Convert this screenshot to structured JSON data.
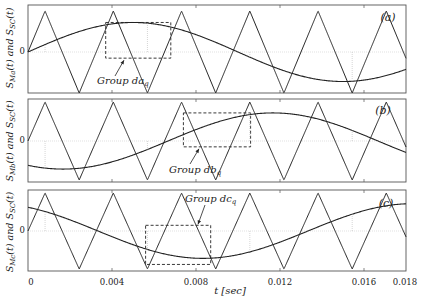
{
  "chart_data": {
    "type": "line",
    "title": "",
    "xlabel": "t [sec]",
    "xlim": [
      0,
      0.018
    ],
    "xticks": [
      0,
      0.004,
      0.008,
      0.012,
      0.016,
      0.018
    ],
    "xtick_labels": [
      "0",
      "0.004",
      "0.008",
      "0.012",
      "0.016",
      "0.018"
    ],
    "ylim": [
      -1,
      1
    ],
    "yticks": [
      0
    ],
    "ytick_labels": [
      "0"
    ],
    "grid": false,
    "carrier": {
      "name": "S_SC(t)",
      "shape": "triangle",
      "amplitude": 1,
      "period_sec": 0.00325,
      "start_phase": "rising from 0 at t=0"
    },
    "panels": [
      {
        "id": "a",
        "tag": "(a)",
        "ylabel": "S_Ma(t) and S_SC(t)",
        "series": [
          {
            "name": "S_Ma(t)",
            "shape": "sine",
            "amplitude": 0.72,
            "frequency_hz": 50,
            "phase_deg": 0
          },
          {
            "name": "S_SC(t)",
            "shape": "triangle"
          }
        ],
        "annotation": {
          "label": "Group da_q",
          "box_t": [
            0.0037,
            0.0068
          ],
          "box_y": [
            -0.15,
            0.72
          ]
        }
      },
      {
        "id": "b",
        "tag": "(b)",
        "ylabel": "S_Mb(t) and S_SC(t)",
        "series": [
          {
            "name": "S_Mb(t)",
            "shape": "sine",
            "amplitude": 0.72,
            "frequency_hz": 50,
            "phase_deg": -120
          },
          {
            "name": "S_SC(t)",
            "shape": "triangle"
          }
        ],
        "annotation": {
          "label": "Group db_q",
          "box_t": [
            0.0074,
            0.0106
          ],
          "box_y": [
            -0.15,
            0.72
          ]
        }
      },
      {
        "id": "c",
        "tag": "(c)",
        "ylabel": "S_Mc(t) and S_SC(t)",
        "series": [
          {
            "name": "S_Mc(t)",
            "shape": "sine",
            "amplitude": 0.72,
            "frequency_hz": 50,
            "phase_deg": 120
          },
          {
            "name": "S_SC(t)",
            "shape": "triangle"
          }
        ],
        "annotation": {
          "label": "Group dc_q",
          "box_t": [
            0.0056,
            0.0087
          ],
          "box_y": [
            -0.88,
            0.15
          ]
        }
      }
    ]
  },
  "labels": {
    "xlabel": "t [sec]",
    "zero": "0",
    "tag_a": "(a)",
    "tag_b": "(b)",
    "tag_c": "(c)",
    "group_a": "Group da",
    "group_b": "Group db",
    "group_c": "Group dc",
    "sub_q": "q",
    "ylabel_a_pre": "S",
    "ylabel_a_sub": "Ma",
    "ylabel_b_sub": "Mb",
    "ylabel_c_sub": "Mc",
    "ylabel_mid": "(t) and S",
    "ylabel_sc_sub": "SC",
    "ylabel_end": "(t)",
    "ticks": [
      "0",
      "0.004",
      "0.008",
      "0.012",
      "0.016",
      "0.018"
    ]
  }
}
